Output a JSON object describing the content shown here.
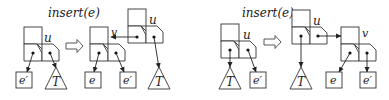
{
  "figure": {
    "left_panel": {
      "operation_label": "insert(e)",
      "before": {
        "node_label": "u",
        "children": [
          {
            "kind": "leaf-box",
            "label": "e′"
          },
          {
            "kind": "subtree-triangle",
            "label": "T"
          }
        ]
      },
      "after": {
        "new_node_label": "v",
        "parent_node_label": "u",
        "children_of_v": [
          {
            "kind": "leaf-box",
            "label": "e"
          },
          {
            "kind": "leaf-box",
            "label": "e′"
          }
        ],
        "children_of_u": [
          {
            "kind": "subtree-triangle",
            "label": "T"
          }
        ]
      }
    },
    "right_panel": {
      "operation_label": "insert(e)",
      "before": {
        "node_label": "u",
        "children": [
          {
            "kind": "subtree-triangle",
            "label": "T"
          },
          {
            "kind": "leaf-box",
            "label": "e′"
          }
        ]
      },
      "after": {
        "parent_node_label": "u",
        "new_node_label": "v",
        "children_of_u": [
          {
            "kind": "subtree-triangle",
            "label": "T"
          }
        ],
        "children_of_v": [
          {
            "kind": "leaf-box",
            "label": "e"
          },
          {
            "kind": "leaf-box",
            "label": "e′"
          }
        ]
      }
    },
    "transition_arrow_icon": "hollow-right-arrow"
  }
}
